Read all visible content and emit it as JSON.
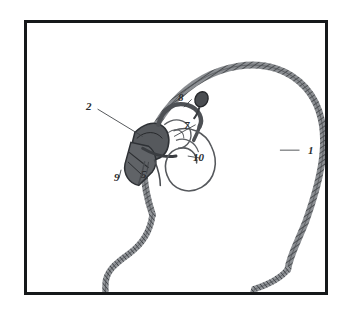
{
  "figure": {
    "type": "patent-line-drawing",
    "frame_color": "#16181a",
    "background_color": "#ffffff",
    "outline_color": "#5a5d61",
    "labels": [
      {
        "id": "1",
        "text": "1",
        "x": 283,
        "y": 148,
        "desc": "head-outline-skin"
      },
      {
        "id": "2",
        "text": "2",
        "x": 86,
        "y": 101,
        "desc": "implant-receiver-body"
      },
      {
        "id": "5",
        "text": "5",
        "x": 141,
        "y": 169,
        "desc": "electrode-lead"
      },
      {
        "id": "7",
        "text": "7",
        "x": 184,
        "y": 120,
        "desc": "coil-connector"
      },
      {
        "id": "8",
        "text": "8",
        "x": 178,
        "y": 92,
        "desc": "external-transmitter"
      },
      {
        "id": "9",
        "text": "9",
        "x": 114,
        "y": 172,
        "desc": "ear-canal"
      },
      {
        "id": "10",
        "text": "10",
        "x": 193,
        "y": 152,
        "desc": "cochlea"
      }
    ]
  }
}
